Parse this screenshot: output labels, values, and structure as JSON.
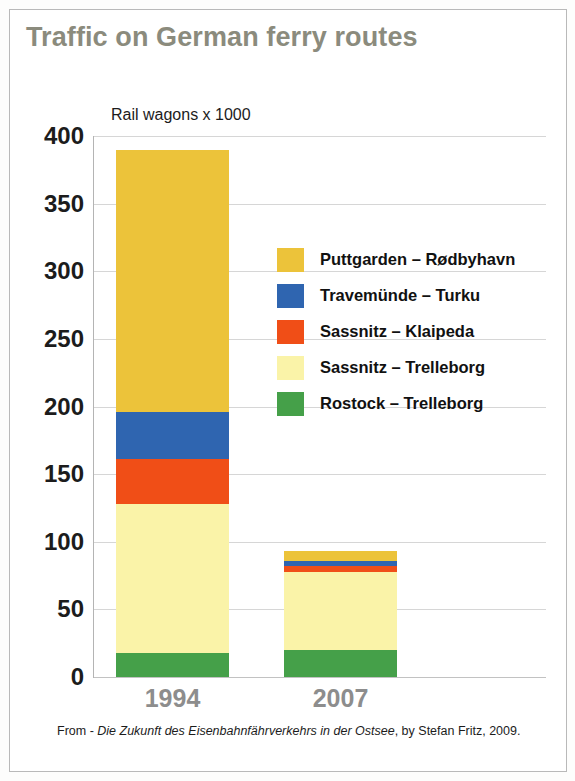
{
  "slide": {
    "title": "Traffic on German ferry routes",
    "title_color": "#8b8b7d",
    "background": "#ffffff",
    "border_color": "#b9b9b9"
  },
  "footer": {
    "prefix": "From - ",
    "source_title": "Die Zukunft des Eisenbahnfährverkehrs in der Ostsee",
    "suffix": ", by Stefan Fritz, 2009."
  },
  "chart_data": {
    "type": "bar",
    "subtype": "stacked",
    "title": "Traffic on German ferry routes",
    "subtitle": "",
    "axis_caption": "Rail wagons x 1000",
    "xlabel": "",
    "ylabel": "Rail wagons x 1000",
    "categories": [
      "1994",
      "2007"
    ],
    "ylim": [
      0,
      400
    ],
    "yticks": [
      0,
      50,
      100,
      150,
      200,
      250,
      300,
      350,
      400
    ],
    "ytick_labels": [
      "0",
      "50",
      "100",
      "150",
      "200",
      "250",
      "300",
      "350",
      "400"
    ],
    "grid": true,
    "grid_axis": "y",
    "legend_position": "inside-right",
    "stack_order_bottom_to_top": [
      "Rostock – Trelleborg",
      "Sassnitz – Trelleborg",
      "Sassnitz – Klaipeda",
      "Travemünde – Turku",
      "Puttgarden – Rødbyhavn"
    ],
    "series": [
      {
        "name": "Puttgarden – Rødbyhavn",
        "color": "#ecc33a",
        "values": [
          194,
          7
        ]
      },
      {
        "name": "Travemünde – Turku",
        "color": "#2f65b0",
        "values": [
          35,
          4
        ]
      },
      {
        "name": "Sassnitz – Klaipeda",
        "color": "#f04e17",
        "values": [
          33,
          4
        ]
      },
      {
        "name": "Sassnitz – Trelleborg",
        "color": "#faf3a8",
        "values": [
          110,
          58
        ]
      },
      {
        "name": "Rostock – Trelleborg",
        "color": "#45a049",
        "values": [
          18,
          20
        ]
      }
    ],
    "totals": [
      390,
      93
    ]
  },
  "legend": {
    "items": [
      {
        "label": "Puttgarden – Rødbyhavn",
        "color": "#ecc33a"
      },
      {
        "label": "Travemünde – Turku",
        "color": "#2f65b0"
      },
      {
        "label": "Sassnitz – Klaipeda",
        "color": "#f04e17"
      },
      {
        "label": "Sassnitz – Trelleborg",
        "color": "#faf3a8"
      },
      {
        "label": "Rostock – Trelleborg",
        "color": "#45a049"
      }
    ]
  }
}
